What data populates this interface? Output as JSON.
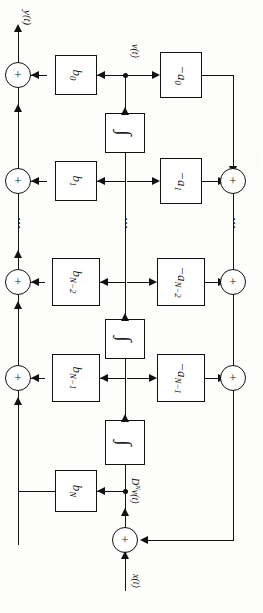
{
  "figure": {
    "type": "block-diagram",
    "orientation_deg": 90,
    "signals": {
      "input": "x(t)",
      "output": "y(t)",
      "state": "v(t)",
      "top_state_derivative": "Dᴺv(t)"
    },
    "integrator_symbol": "∫",
    "summer_symbol": "+",
    "ellipsis_symbol": "⋮",
    "feedforward_gains": [
      {
        "id": "b0",
        "base": "b",
        "sub": "0"
      },
      {
        "id": "b1",
        "base": "b",
        "sub": "1"
      },
      {
        "id": "bN2",
        "base": "b",
        "sub": "N−2"
      },
      {
        "id": "bN1",
        "base": "b",
        "sub": "N−1"
      },
      {
        "id": "bN",
        "base": "b",
        "sub": "N"
      }
    ],
    "feedback_gains": [
      {
        "id": "a0",
        "base": "−a",
        "sub": "0"
      },
      {
        "id": "a1",
        "base": "−a",
        "sub": "1"
      },
      {
        "id": "aN2",
        "base": "−a",
        "sub": "N−2"
      },
      {
        "id": "aN1",
        "base": "−a",
        "sub": "N−1"
      }
    ],
    "integrator_count_shown": 4,
    "summer_count_shown": 9,
    "colors": {
      "line": "#111111",
      "paper": "#fdfdfc",
      "box_fill": "#ffffff"
    }
  },
  "margin_caption": {
    "text": "· · · · · · · ·"
  }
}
